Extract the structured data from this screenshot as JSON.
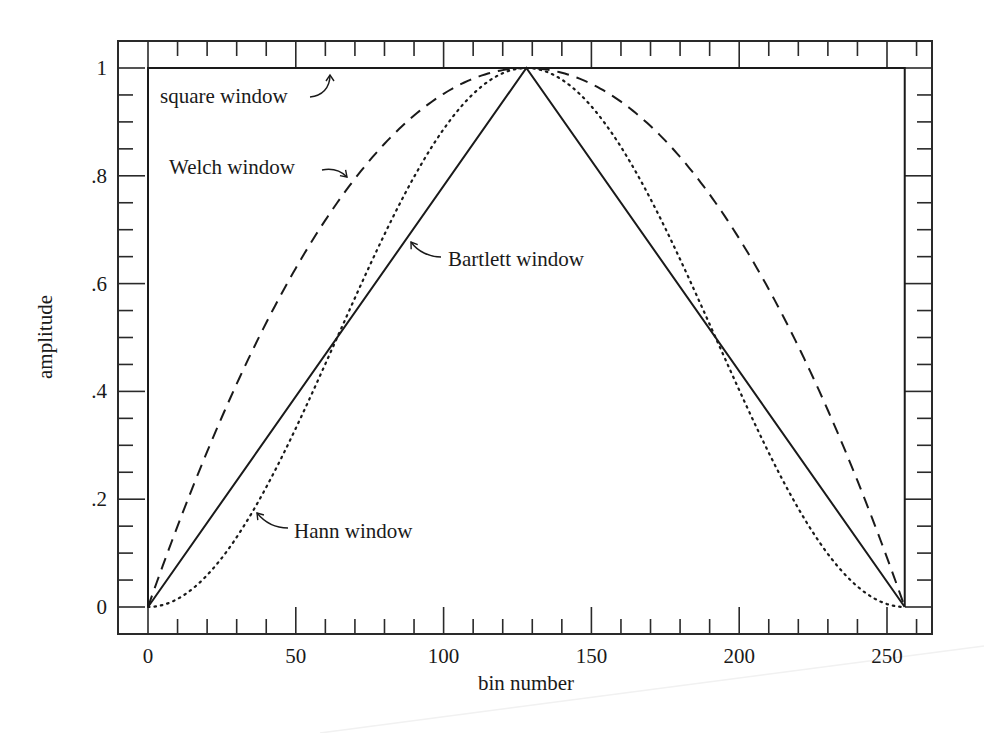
{
  "chart_data": {
    "type": "line",
    "title": "",
    "xlabel": "bin number",
    "ylabel": "amplitude",
    "xlim": [
      -10,
      266
    ],
    "ylim": [
      -0.05,
      1.05
    ],
    "grid": false,
    "legend": "none (curves labeled by annotations)",
    "x_ticks": [
      0,
      50,
      100,
      150,
      200,
      250
    ],
    "x_tick_labels": [
      "0",
      "50",
      "100",
      "150",
      "200",
      "250"
    ],
    "x_minor_step": 10,
    "y_ticks": [
      0,
      0.2,
      0.4,
      0.6,
      0.8,
      1
    ],
    "y_tick_labels": [
      "0",
      ".2",
      ".4",
      ".6",
      ".8",
      "1"
    ],
    "y_minor_step": 0.05,
    "N": 256,
    "series": [
      {
        "name": "square window",
        "style": "solid",
        "x": [
          0,
          0,
          256,
          256
        ],
        "y": [
          0,
          1,
          1,
          0
        ]
      },
      {
        "name": "Bartlett window",
        "style": "solid",
        "x": [
          0,
          128,
          256
        ],
        "y": [
          0,
          1,
          0
        ]
      },
      {
        "name": "Welch window",
        "style": "dashed",
        "formula": "1 - ((j - N/2)/(N/2))^2",
        "x": [
          0,
          16,
          32,
          48,
          64,
          80,
          96,
          112,
          128,
          144,
          160,
          176,
          192,
          208,
          224,
          240,
          256
        ],
        "y": [
          0,
          0.234,
          0.438,
          0.609,
          0.75,
          0.859,
          0.938,
          0.984,
          1,
          0.984,
          0.938,
          0.859,
          0.75,
          0.609,
          0.438,
          0.234,
          0
        ]
      },
      {
        "name": "Hann window",
        "style": "dotted",
        "formula": "0.5 * (1 - cos(2*pi*j/N))",
        "x": [
          0,
          16,
          32,
          48,
          64,
          80,
          96,
          112,
          128,
          144,
          160,
          176,
          192,
          208,
          224,
          240,
          256
        ],
        "y": [
          0,
          0.038,
          0.146,
          0.309,
          0.5,
          0.691,
          0.854,
          0.962,
          1,
          0.962,
          0.854,
          0.691,
          0.5,
          0.309,
          0.146,
          0.038,
          0
        ]
      }
    ],
    "annotations": [
      {
        "text": "square window",
        "points_to": "square window",
        "target": [
          130,
          1.0
        ]
      },
      {
        "text": "Welch window",
        "points_to": "Welch window",
        "target": [
          66,
          0.77
        ]
      },
      {
        "text": "Bartlett window",
        "points_to": "Bartlett window",
        "target": [
          88,
          0.69
        ]
      },
      {
        "text": "Hann window",
        "points_to": "Hann window",
        "target": [
          37,
          0.22
        ]
      }
    ]
  }
}
